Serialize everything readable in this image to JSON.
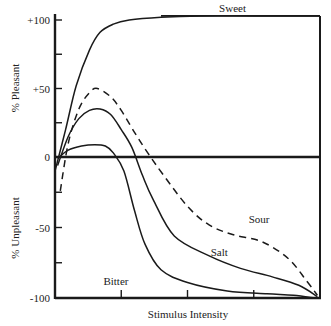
{
  "chart_data": {
    "type": "line",
    "title": "",
    "xlabel": "Stimulus Intensity",
    "ylabel_top": "% Pleasant",
    "ylabel_bottom": "% Unpleasant",
    "ylim": [
      -100,
      100
    ],
    "xlim": [
      0,
      100
    ],
    "yticks": [
      {
        "value": 100,
        "label": "+100"
      },
      {
        "value": 75,
        "label": ""
      },
      {
        "value": 50,
        "label": "+50"
      },
      {
        "value": 25,
        "label": ""
      },
      {
        "value": 0,
        "label": "0"
      },
      {
        "value": -25,
        "label": ""
      },
      {
        "value": -50,
        "label": "-50"
      },
      {
        "value": -75,
        "label": ""
      },
      {
        "value": -100,
        "label": "-100"
      }
    ],
    "xticks": [
      25,
      50,
      75
    ],
    "grid": false,
    "series": [
      {
        "name": "Sweet",
        "style": "solid",
        "label_pos": [
          67,
          106
        ],
        "points": [
          [
            0,
            -10
          ],
          [
            4,
            20
          ],
          [
            8,
            52
          ],
          [
            13,
            78
          ],
          [
            17,
            91
          ],
          [
            22,
            97
          ],
          [
            28,
            100
          ],
          [
            40,
            102
          ],
          [
            55,
            103
          ],
          [
            75,
            103
          ],
          [
            100,
            103
          ]
        ]
      },
      {
        "name": "Sour",
        "style": "dashed",
        "label_pos": [
          77,
          -47
        ],
        "points": [
          [
            2,
            -24
          ],
          [
            5,
            10
          ],
          [
            9,
            35
          ],
          [
            13,
            47
          ],
          [
            16,
            50
          ],
          [
            21,
            44
          ],
          [
            25,
            34
          ],
          [
            30,
            18
          ],
          [
            35,
            3
          ],
          [
            41,
            -13
          ],
          [
            50,
            -35
          ],
          [
            58,
            -48
          ],
          [
            67,
            -55
          ],
          [
            78,
            -60
          ],
          [
            88,
            -72
          ],
          [
            95,
            -88
          ],
          [
            99,
            -98
          ]
        ]
      },
      {
        "name": "Salt",
        "style": "solid",
        "label_pos": [
          62,
          -70
        ],
        "points": [
          [
            1,
            -6
          ],
          [
            5,
            15
          ],
          [
            9,
            28
          ],
          [
            13,
            34
          ],
          [
            17,
            35
          ],
          [
            21,
            31
          ],
          [
            25,
            20
          ],
          [
            29,
            7
          ],
          [
            33,
            -13
          ],
          [
            37,
            -30
          ],
          [
            45,
            -56
          ],
          [
            58,
            -70
          ],
          [
            70,
            -79
          ],
          [
            82,
            -85
          ],
          [
            92,
            -91
          ],
          [
            99,
            -99
          ]
        ]
      },
      {
        "name": "Bitter",
        "style": "solid",
        "label_pos": [
          23,
          -91
        ],
        "points": [
          [
            1,
            -1
          ],
          [
            5,
            5
          ],
          [
            10,
            8
          ],
          [
            15,
            9
          ],
          [
            19,
            8
          ],
          [
            22,
            3
          ],
          [
            26,
            -10
          ],
          [
            30,
            -38
          ],
          [
            34,
            -62
          ],
          [
            40,
            -80
          ],
          [
            50,
            -89
          ],
          [
            65,
            -95
          ],
          [
            80,
            -97
          ],
          [
            90,
            -98
          ],
          [
            98,
            -100
          ]
        ]
      }
    ],
    "frame": {
      "top": 103,
      "right": 100
    }
  }
}
